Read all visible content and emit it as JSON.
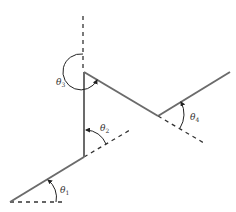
{
  "diagram": {
    "colors": {
      "link": "#6b6b6b",
      "dashed": "#333333",
      "arc": "#222222",
      "text": "#333333",
      "background": "#ffffff"
    },
    "labels": {
      "theta1": {
        "symbol": "θ",
        "subscript": "1"
      },
      "theta2": {
        "symbol": "θ",
        "subscript": "2"
      },
      "theta3": {
        "symbol": "θ",
        "subscript": "3"
      },
      "theta4": {
        "symbol": "θ",
        "subscript": "4"
      }
    }
  }
}
